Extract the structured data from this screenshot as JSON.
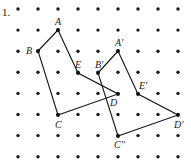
{
  "figure": {
    "problem_number": "1.",
    "width": 191,
    "height": 163,
    "background_color": "#ffffff",
    "ink_color": "#1a1a1a"
  },
  "grid": {
    "columns": 9,
    "rows": 8,
    "x_start": 18,
    "y_start": 9,
    "x_step": 20,
    "y_step": 21.1,
    "dot_radius": 1.7,
    "dot_color": "#1a1a1a"
  },
  "shapes": [
    {
      "name": "pentagon-original",
      "vertices": [
        {
          "label": "A",
          "x": 58,
          "y": 30,
          "label_dx": -3,
          "label_dy": -13
        },
        {
          "label": "B",
          "x": 38,
          "y": 51,
          "label_dx": -12,
          "label_dy": -5
        },
        {
          "label": "C",
          "x": 58,
          "y": 115,
          "label_dx": -3,
          "label_dy": 5
        },
        {
          "label": "D",
          "x": 118,
          "y": 94,
          "label_dx": -8,
          "label_dy": 4
        },
        {
          "label": "E",
          "x": 78,
          "y": 73,
          "label_dx": -3,
          "label_dy": -13
        }
      ],
      "order": [
        "A",
        "B",
        "C",
        "D",
        "E"
      ],
      "closed": true
    },
    {
      "name": "pentagon-image",
      "vertices": [
        {
          "label": "A'",
          "x": 118,
          "y": 51,
          "label_dx": -3,
          "label_dy": -13
        },
        {
          "label": "B'",
          "x": 98,
          "y": 73,
          "label_dx": -3,
          "label_dy": -13
        },
        {
          "label": "C''",
          "x": 118,
          "y": 136,
          "label_dx": -4,
          "label_dy": 4
        },
        {
          "label": "D'",
          "x": 178,
          "y": 115,
          "label_dx": -4,
          "label_dy": 5
        },
        {
          "label": "E'",
          "x": 138,
          "y": 94,
          "label_dx": 1,
          "label_dy": -13
        }
      ],
      "order": [
        "A'",
        "B'",
        "C''",
        "D'",
        "E'"
      ],
      "closed": true
    }
  ]
}
